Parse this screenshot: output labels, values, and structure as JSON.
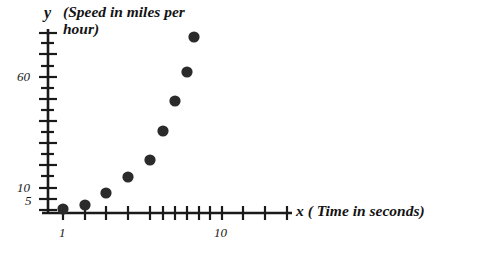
{
  "figure": {
    "background_color": "#ffffff",
    "ink_color": "#1a1a1a",
    "marker_color": "#2b2b2b"
  },
  "axes": {
    "y": {
      "variable_symbol": "y",
      "label": "(Speed in miles per\nhour)",
      "label_line1": "(Speed in miles per",
      "label_line2": "hour)",
      "tick_labels": [
        "60",
        "10",
        "5"
      ],
      "scale": "log",
      "tick_count": 17
    },
    "x": {
      "variable_symbol": "x",
      "label": "( Time in seconds)",
      "full_label": "x ( Time in seconds)",
      "tick_labels": [
        "1",
        "10"
      ],
      "scale": "log",
      "tick_count": 13
    }
  },
  "chart_data": {
    "type": "scatter",
    "title": "",
    "xlabel": "x ( Time in seconds)",
    "ylabel": "y  (Speed in miles per hour)",
    "xscale": "log",
    "yscale": "log",
    "grid": false,
    "legend": null,
    "xlim": [
      1,
      30
    ],
    "ylim": [
      4,
      110
    ],
    "x_tick_labels": [
      "1",
      "10"
    ],
    "y_tick_labels": [
      "5",
      "10",
      "60"
    ],
    "marker": "filled-circle",
    "marker_color": "#2b2b2b",
    "series": [
      {
        "name": "speed",
        "x": [
          1.0,
          1.4,
          2.0,
          2.8,
          3.9,
          4.7,
          5.6,
          6.6,
          7.3
        ],
        "y": [
          5.0,
          5.8,
          8.5,
          13.0,
          20.0,
          31.0,
          46.0,
          66.0,
          100.0
        ],
        "points": [
          {
            "x": 1.0,
            "y": 5.0
          },
          {
            "x": 1.4,
            "y": 5.8
          },
          {
            "x": 2.0,
            "y": 8.5
          },
          {
            "x": 2.8,
            "y": 13.0
          },
          {
            "x": 3.9,
            "y": 20.0
          },
          {
            "x": 4.7,
            "y": 31.0
          },
          {
            "x": 5.6,
            "y": 46.0
          },
          {
            "x": 6.6,
            "y": 66.0
          },
          {
            "x": 7.3,
            "y": 100.0
          }
        ]
      }
    ]
  },
  "geometry": {
    "y_axis_x": 48,
    "x_axis_y": 213,
    "y_axis_top": 29,
    "x_axis_right": 292,
    "marker_radius": 5.6,
    "pixel_points": [
      {
        "cx": 63,
        "cy": 209
      },
      {
        "cx": 85,
        "cy": 205
      },
      {
        "cx": 106,
        "cy": 193
      },
      {
        "cx": 128,
        "cy": 177
      },
      {
        "cx": 150,
        "cy": 160
      },
      {
        "cx": 163,
        "cy": 131
      },
      {
        "cx": 175,
        "cy": 101
      },
      {
        "cx": 187,
        "cy": 72
      },
      {
        "cx": 194,
        "cy": 37
      }
    ],
    "y_tick_pixels": [
      33,
      43,
      54,
      66,
      77,
      88,
      99,
      110,
      121,
      132,
      143,
      154,
      165,
      176,
      188,
      199,
      210
    ],
    "y_label_pixels": {
      "60": 77,
      "10": 188,
      "5": 201
    },
    "x_tick_pixels": [
      63,
      85,
      106,
      128,
      150,
      163,
      175,
      187,
      199,
      210,
      222,
      243,
      265,
      287
    ],
    "x_label_pixels": {
      "1": 63,
      "10": 222
    }
  }
}
